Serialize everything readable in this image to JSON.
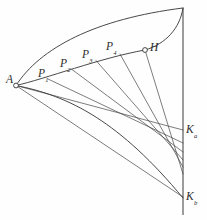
{
  "figure": {
    "background_color": "#fefefe",
    "stroke_color": "#3a3a3a",
    "width": 207,
    "height": 220
  },
  "labels": {
    "a": {
      "text": "A",
      "x": 6,
      "y": 74
    },
    "p1": {
      "base": "P",
      "sub": "1",
      "x": 38,
      "y": 68
    },
    "p2": {
      "base": "P",
      "sub": "2",
      "x": 60,
      "y": 58
    },
    "p3": {
      "base": "P",
      "sub": "3",
      "x": 82,
      "y": 49
    },
    "p4": {
      "base": "P",
      "sub": "4",
      "x": 106,
      "y": 41
    },
    "h": {
      "text": "H",
      "x": 150,
      "y": 42
    },
    "ka": {
      "base": "K",
      "sub": "a",
      "x": 186,
      "y": 124
    },
    "kb": {
      "base": "K",
      "sub": "b",
      "x": 186,
      "y": 191
    }
  },
  "nodes": [
    {
      "name": "A",
      "x": 16,
      "y": 85.5,
      "r": 2.4
    },
    {
      "name": "H",
      "x": 145,
      "y": 50,
      "r": 2.4
    }
  ],
  "chart_data": {
    "type": "line",
    "xlabel": "",
    "ylabel": "",
    "points": [
      {
        "label": "A",
        "x": 16,
        "y": 85.5
      },
      {
        "label": "P1",
        "x": 48,
        "y": 79
      },
      {
        "label": "P2",
        "x": 72,
        "y": 69.5
      },
      {
        "label": "P3",
        "x": 96,
        "y": 60.5
      },
      {
        "label": "P4",
        "x": 120,
        "y": 54
      },
      {
        "label": "H",
        "x": 145,
        "y": 50
      },
      {
        "label": "Top",
        "x": 183,
        "y": 8
      },
      {
        "label": "Ka",
        "x": 183,
        "y": 130
      },
      {
        "label": "Kb",
        "x": 183,
        "y": 197
      }
    ],
    "curves": [
      {
        "name": "outer-arc",
        "description": "Upper arc from A rising to the top of the vertical axis",
        "path": "M 16 85.5 C 40 48 95 19 183 8"
      },
      {
        "name": "point-curve",
        "description": "Lower curve from A through P1..P4 to H",
        "path": "M 16 85.5 C 45 79 100 58 145 50"
      },
      {
        "name": "h-to-top-arc",
        "description": "Arc from H rising to the top of the vertical axis",
        "path": "M 145 50 C 166 44 180 28 183 8"
      },
      {
        "name": "envelope-curve",
        "description": "Caustic envelope tangent to the ray family, descending from A to Kb",
        "path": "M 16 85.5 C 70 96 120 122 183 198"
      }
    ],
    "axis": {
      "name": "vertical-axis",
      "x": 183,
      "y_top": 8,
      "y_bottom": 215
    },
    "rays": [
      {
        "from": "A",
        "x1": 16,
        "y1": 85.5,
        "x2": 183,
        "y2": 130
      },
      {
        "from": "P1",
        "x1": 48,
        "y1": 79,
        "x2": 183,
        "y2": 143
      },
      {
        "from": "P2",
        "x1": 72,
        "y1": 69.5,
        "x2": 183,
        "y2": 152
      },
      {
        "from": "P3",
        "x1": 96,
        "y1": 60.5,
        "x2": 183,
        "y2": 160
      },
      {
        "from": "P4",
        "x1": 120,
        "y1": 54,
        "x2": 183,
        "y2": 167
      },
      {
        "from": "H",
        "x1": 145,
        "y1": 50,
        "x2": 183,
        "y2": 174
      },
      {
        "from": "A",
        "x1": 16,
        "y1": 85.5,
        "x2": 183,
        "y2": 197
      }
    ],
    "grid": false,
    "legend": "none"
  }
}
